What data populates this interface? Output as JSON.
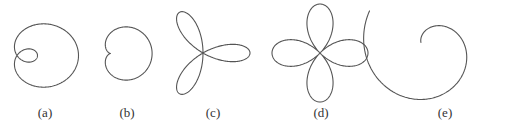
{
  "figure": {
    "panels": [
      {
        "id": "a",
        "label": "(a)",
        "curve": "limacon-with-inner-loop",
        "label_x": 45
      },
      {
        "id": "b",
        "label": "(b)",
        "curve": "cardioid",
        "label_x": 127
      },
      {
        "id": "c",
        "label": "(c)",
        "curve": "three-petal-rose",
        "label_x": 213
      },
      {
        "id": "d",
        "label": "(d)",
        "curve": "four-petal-rose",
        "label_x": 321
      },
      {
        "id": "e",
        "label": "(e)",
        "curve": "spiral",
        "label_x": 445
      }
    ],
    "stroke_color": "#555555",
    "background": "#ffffff"
  }
}
